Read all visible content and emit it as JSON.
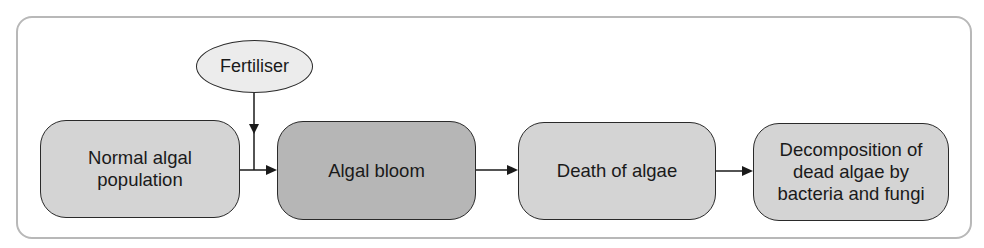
{
  "diagram": {
    "title": "",
    "input": {
      "label": "Fertiliser",
      "shape": "ellipse"
    },
    "steps": [
      {
        "label": "Normal algal\npopulation",
        "fill": "#d4d4d4"
      },
      {
        "label": "Algal bloom",
        "fill": "#b6b6b6"
      },
      {
        "label": "Death of algae",
        "fill": "#d4d4d4"
      },
      {
        "label": "Decomposition of\ndead algae by\nbacteria and fungi",
        "fill": "#d4d4d4"
      }
    ],
    "edges": [
      {
        "from": "Normal algal population",
        "to": "Algal bloom"
      },
      {
        "from": "Fertiliser",
        "to": "Algal bloom"
      },
      {
        "from": "Algal bloom",
        "to": "Death of algae"
      },
      {
        "from": "Death of algae",
        "to": "Decomposition of dead algae by bacteria and fungi"
      }
    ],
    "colors": {
      "frame": "#b8b8b8",
      "stroke": "#2a2a2a",
      "light_fill": "#d4d4d4",
      "dark_fill": "#b6b6b6",
      "ellipse_fill": "#ececec"
    }
  }
}
